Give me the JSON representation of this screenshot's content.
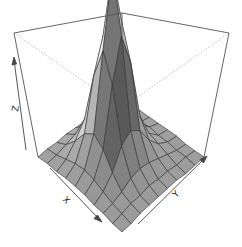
{
  "chart_data": {
    "type": "surface3d",
    "title": "",
    "xlabel": "X",
    "ylabel": "Y",
    "zlabel": "Z",
    "grid": false,
    "box": true,
    "shading": "grayscale",
    "grid_size": [
      10,
      10
    ],
    "x": [
      1,
      2,
      3,
      4,
      5,
      6,
      7,
      8,
      9,
      10
    ],
    "y": [
      1,
      2,
      3,
      4,
      5,
      6,
      7,
      8,
      9,
      10
    ],
    "z": [
      [
        0.0,
        0.01,
        0.01,
        0.02,
        0.02,
        0.02,
        0.01,
        0.01,
        0.0,
        0.0
      ],
      [
        0.01,
        0.02,
        0.04,
        0.06,
        0.07,
        0.06,
        0.04,
        0.02,
        0.01,
        0.0
      ],
      [
        0.01,
        0.04,
        0.1,
        0.18,
        0.22,
        0.18,
        0.1,
        0.04,
        0.02,
        0.01
      ],
      [
        0.02,
        0.06,
        0.18,
        0.45,
        0.62,
        0.48,
        0.2,
        0.07,
        0.02,
        0.01
      ],
      [
        0.02,
        0.07,
        0.22,
        0.62,
        1.0,
        0.7,
        0.24,
        0.08,
        0.03,
        0.01
      ],
      [
        0.02,
        0.06,
        0.18,
        0.48,
        0.7,
        0.52,
        0.2,
        0.07,
        0.02,
        0.01
      ],
      [
        0.01,
        0.04,
        0.1,
        0.2,
        0.24,
        0.2,
        0.11,
        0.05,
        0.02,
        0.01
      ],
      [
        0.01,
        0.02,
        0.04,
        0.07,
        0.08,
        0.07,
        0.05,
        0.03,
        0.01,
        0.0
      ],
      [
        0.0,
        0.01,
        0.02,
        0.02,
        0.03,
        0.02,
        0.02,
        0.01,
        0.01,
        0.0
      ],
      [
        0.0,
        0.0,
        0.01,
        0.01,
        0.01,
        0.01,
        0.01,
        0.0,
        0.0,
        0.0
      ]
    ],
    "zlim": [
      0,
      1
    ],
    "view": {
      "theta": 45,
      "phi": 30
    }
  },
  "axes": {
    "x_label": "X",
    "y_label": "Y",
    "z_label": "Z"
  },
  "colors": {
    "box_line": "#555555",
    "hidden_line": "#aaaaaa",
    "mesh_line": "#333333",
    "axis_arrow": "#444444"
  }
}
